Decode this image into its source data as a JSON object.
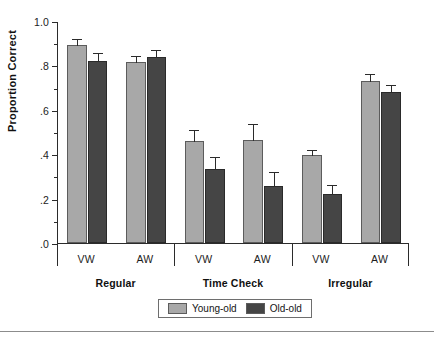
{
  "axis": {
    "y_title": "Proportion Correct",
    "y_ticks": [
      {
        "value": 1.0,
        "label": "1.0"
      },
      {
        "value": 0.9,
        "label": ""
      },
      {
        "value": 0.8,
        "label": ".8"
      },
      {
        "value": 0.7,
        "label": ""
      },
      {
        "value": 0.6,
        "label": ".6"
      },
      {
        "value": 0.5,
        "label": ""
      },
      {
        "value": 0.4,
        "label": ".4"
      },
      {
        "value": 0.3,
        "label": ""
      },
      {
        "value": 0.2,
        "label": ".2"
      },
      {
        "value": 0.1,
        "label": ""
      },
      {
        "value": 0.0,
        "label": ".0"
      }
    ]
  },
  "groups": [
    {
      "label": "Regular",
      "subs": [
        "VW",
        "AW"
      ]
    },
    {
      "label": "Time Check",
      "subs": [
        "VW",
        "AW"
      ]
    },
    {
      "label": "Irregular",
      "subs": [
        "VW",
        "AW"
      ]
    }
  ],
  "legend": {
    "items": [
      {
        "label": "Young-old",
        "color": "#a8a8a8"
      },
      {
        "label": "Old-old",
        "color": "#454545"
      }
    ]
  },
  "colors": {
    "young_old": "#a8a8a8",
    "old_old": "#454545",
    "axis": "#2b2b2b",
    "background": "#ffffff"
  },
  "chart_data": {
    "type": "bar",
    "title": "",
    "xlabel": "",
    "ylabel": "Proportion Correct",
    "ylim": [
      0.0,
      1.0
    ],
    "ytick_values": [
      0.0,
      0.2,
      0.4,
      0.6,
      0.8,
      1.0
    ],
    "ytick_labels": [
      ".0",
      ".2",
      ".4",
      ".6",
      ".8",
      "1.0"
    ],
    "minor_ticks": [
      0.1,
      0.3,
      0.5,
      0.7,
      0.9
    ],
    "grid": false,
    "legend_position": "bottom-center",
    "categories": [
      "Regular / VW",
      "Regular / AW",
      "Time Check / VW",
      "Time Check / AW",
      "Irregular / VW",
      "Irregular / AW"
    ],
    "group_labels": [
      "Regular",
      "Time Check",
      "Irregular"
    ],
    "sub_labels": [
      "VW",
      "AW",
      "VW",
      "AW",
      "VW",
      "AW"
    ],
    "series": [
      {
        "name": "Young-old",
        "color": "#a8a8a8",
        "values": [
          0.89,
          0.815,
          0.46,
          0.465,
          0.395,
          0.73
        ],
        "errors": [
          0.035,
          0.03,
          0.055,
          0.075,
          0.03,
          0.035
        ]
      },
      {
        "name": "Old-old",
        "color": "#454545",
        "values": [
          0.82,
          0.84,
          0.335,
          0.255,
          0.22,
          0.68
        ],
        "errors": [
          0.04,
          0.035,
          0.055,
          0.07,
          0.045,
          0.035
        ]
      }
    ]
  }
}
